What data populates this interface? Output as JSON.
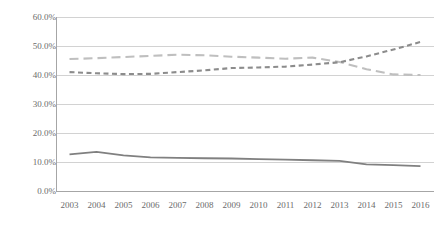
{
  "chart_data": {
    "type": "line",
    "title": "",
    "xlabel": "",
    "ylabel": "",
    "ylim": [
      0,
      60
    ],
    "ytick_labels": [
      "60.0%",
      "50.0%",
      "40.0%",
      "30.0%",
      "20.0%",
      "10.0%",
      "0.0%"
    ],
    "ytick_values": [
      60,
      50,
      40,
      30,
      20,
      10,
      0
    ],
    "grid": true,
    "legend": "none",
    "categories": [
      "2003",
      "2004",
      "2005",
      "2006",
      "2007",
      "2008",
      "2009",
      "2010",
      "2011",
      "2012",
      "2013",
      "2014",
      "2015",
      "2016"
    ],
    "series": [
      {
        "name": "light-gray-dashed-series",
        "style": "long-dash",
        "color": "#bfbfbf",
        "values": [
          45.5,
          45.8,
          46.2,
          46.6,
          47.0,
          46.8,
          46.3,
          46.0,
          45.6,
          46.0,
          44.5,
          42.0,
          40.2,
          40.0
        ]
      },
      {
        "name": "dark-gray-dashed-series",
        "style": "short-dash",
        "color": "#8c8c8c",
        "values": [
          41.0,
          40.6,
          40.3,
          40.4,
          41.0,
          41.6,
          42.4,
          42.6,
          42.9,
          43.6,
          44.4,
          46.4,
          48.8,
          51.4
        ]
      },
      {
        "name": "dark-gray-solid-series",
        "style": "solid",
        "color": "#808080",
        "values": [
          12.6,
          13.5,
          12.3,
          11.6,
          11.4,
          11.3,
          11.2,
          11.0,
          10.8,
          10.6,
          10.4,
          9.2,
          8.9,
          8.6
        ]
      }
    ]
  },
  "colors": {
    "gridline": "#d2d2d2",
    "axis": "#a6a6a6",
    "tick_text": "#6b6b6b",
    "series_light": "#bfbfbf",
    "series_dark_dashed": "#8c8c8c",
    "series_solid": "#808080"
  }
}
